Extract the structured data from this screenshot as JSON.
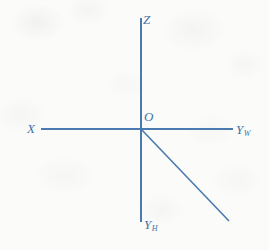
{
  "figure": {
    "kind": "coordinate-axes-diagram",
    "background_color": "#fbfbfa",
    "line_color": "#4a7ab0",
    "label_color": "#3f72a8"
  },
  "labels": {
    "z": {
      "text": "Z",
      "subscript": ""
    },
    "origin": {
      "text": "O",
      "subscript": ""
    },
    "x": {
      "text": "X",
      "subscript": ""
    },
    "y_w": {
      "text": "Y",
      "subscript": "W"
    },
    "y_h": {
      "text": "Y",
      "subscript": "H"
    }
  },
  "geometry": {
    "origin": {
      "x": 141,
      "y": 129
    },
    "axes": [
      {
        "name": "z-axis",
        "x1": 141,
        "y1": 18,
        "x2": 141,
        "y2": 129
      },
      {
        "name": "y-h-axis",
        "x1": 141,
        "y1": 129,
        "x2": 141,
        "y2": 222
      },
      {
        "name": "x-axis",
        "x1": 41,
        "y1": 129,
        "x2": 141,
        "y2": 129
      },
      {
        "name": "y-w-axis",
        "x1": 141,
        "y1": 129,
        "x2": 233,
        "y2": 129
      },
      {
        "name": "diagonal-axis",
        "x1": 141,
        "y1": 129,
        "x2": 229,
        "y2": 221
      }
    ]
  }
}
